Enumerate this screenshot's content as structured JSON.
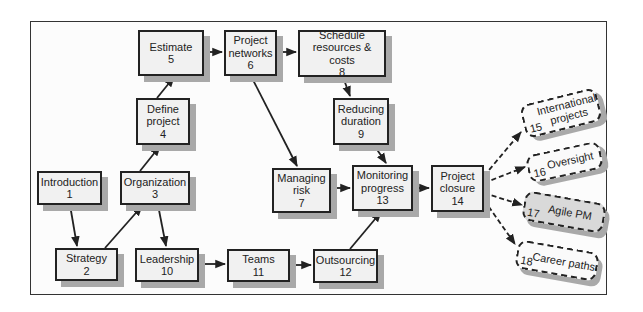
{
  "diagram": {
    "type": "flowchart",
    "nodes": {
      "n1": {
        "label": "Introduction",
        "number": "1"
      },
      "n2": {
        "label": "Strategy",
        "number": "2"
      },
      "n3": {
        "label": "Organization",
        "number": "3"
      },
      "n4": {
        "label_line1": "Define",
        "label_line2": "project",
        "number": "4"
      },
      "n5": {
        "label": "Estimate",
        "number": "5"
      },
      "n6": {
        "label_line1": "Project",
        "label_line2": "networks",
        "number": "6"
      },
      "n7": {
        "label_line1": "Managing",
        "label_line2": "risk",
        "number": "7"
      },
      "n8": {
        "label_line1": "Schedule",
        "label_line2": "resources & costs",
        "number": "8"
      },
      "n9": {
        "label_line1": "Reducing",
        "label_line2": "duration",
        "number": "9"
      },
      "n10": {
        "label": "Leadership",
        "number": "10"
      },
      "n11": {
        "label": "Teams",
        "number": "11"
      },
      "n12": {
        "label": "Outsourcing",
        "number": "12"
      },
      "n13": {
        "label_line1": "Monitoring",
        "label_line2": "progress",
        "number": "13"
      },
      "n14": {
        "label_line1": "Project",
        "label_line2": "closure",
        "number": "14"
      },
      "n15": {
        "label_line1": "International",
        "label_line2": "projects",
        "number": "15"
      },
      "n16": {
        "label": "Oversight",
        "number": "16"
      },
      "n17": {
        "label": "Agile PM",
        "number": "17"
      },
      "n18": {
        "label": "Career paths",
        "number": "18"
      }
    },
    "edges": [
      {
        "from": "1",
        "to": "2",
        "style": "solid"
      },
      {
        "from": "2",
        "to": "3",
        "style": "solid"
      },
      {
        "from": "3",
        "to": "4",
        "style": "solid"
      },
      {
        "from": "3",
        "to": "10",
        "style": "solid"
      },
      {
        "from": "4",
        "to": "5",
        "style": "solid"
      },
      {
        "from": "5",
        "to": "6",
        "style": "solid"
      },
      {
        "from": "6",
        "to": "8",
        "style": "solid"
      },
      {
        "from": "6",
        "to": "7",
        "style": "solid"
      },
      {
        "from": "8",
        "to": "9",
        "style": "solid"
      },
      {
        "from": "9",
        "to": "13",
        "style": "solid"
      },
      {
        "from": "7",
        "to": "13",
        "style": "solid"
      },
      {
        "from": "10",
        "to": "11",
        "style": "solid"
      },
      {
        "from": "11",
        "to": "12",
        "style": "solid"
      },
      {
        "from": "12",
        "to": "13",
        "style": "solid"
      },
      {
        "from": "13",
        "to": "14",
        "style": "solid"
      },
      {
        "from": "14",
        "to": "15",
        "style": "dashed"
      },
      {
        "from": "14",
        "to": "16",
        "style": "dashed"
      },
      {
        "from": "14",
        "to": "17",
        "style": "dashed"
      },
      {
        "from": "14",
        "to": "18",
        "style": "dashed"
      }
    ]
  }
}
